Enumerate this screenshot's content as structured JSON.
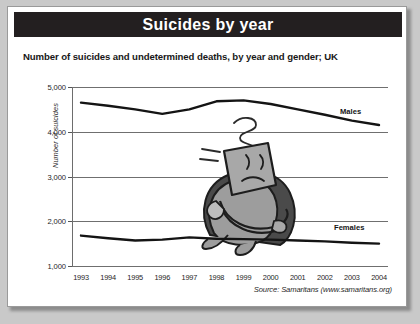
{
  "card": {
    "title": "Suicides by year",
    "subtitle": "Number of suicides and undetermined deaths, by year and gender; UK",
    "source": "Source: Samaritans (www.samaritans.org)"
  },
  "colors": {
    "title_bar": "#231f20",
    "title_text": "#ffffff",
    "card_background": "#ffffff",
    "page_background": "#c9c9c9",
    "series_line": "#141414",
    "gridline": "#6f6f6f"
  },
  "chart_data": {
    "type": "line",
    "title": "Suicides by year",
    "subtitle": "Number of suicides and undetermined deaths, by year and gender; UK",
    "xlabel": "",
    "ylabel": "Number of suicides",
    "categories": [
      "1993",
      "1994",
      "1995",
      "1996",
      "1997",
      "1998",
      "1999",
      "2000",
      "2001",
      "2002",
      "2003",
      "2004"
    ],
    "ylim": [
      1000,
      5000
    ],
    "ytick_labels": [
      "5,000",
      "4,000",
      "3,000",
      "2,000",
      "1,000"
    ],
    "ytick_values": [
      5000,
      4000,
      3000,
      2000,
      1000
    ],
    "grid": true,
    "legend_position": "inline-right",
    "series": [
      {
        "name": "Males",
        "values": [
          4650,
          4580,
          4500,
          4400,
          4500,
          4680,
          4700,
          4620,
          4500,
          4380,
          4250,
          4150
        ]
      },
      {
        "name": "Females",
        "values": [
          1680,
          1620,
          1570,
          1590,
          1640,
          1610,
          1600,
          1590,
          1570,
          1550,
          1520,
          1500
        ]
      }
    ],
    "annotations": [
      {
        "name": "cartoon-figure",
        "description": "Illustration of a distressed person hugging their knees"
      }
    ]
  }
}
